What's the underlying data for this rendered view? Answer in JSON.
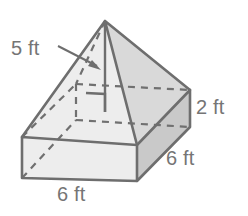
{
  "figure": {
    "name": "composite-solid-rectangular-prism-with-pyramid",
    "colors": {
      "outline": "#6e6e6e",
      "hidden_edge": "#6e6e6e",
      "face_left_pyramid": "#f2f2f2",
      "face_right_pyramid": "#d9d9d9",
      "face_top_prism": "#e0e0e0",
      "face_front_prism": "#ededed",
      "face_right_prism": "#c9c9c9",
      "label_text": "#757575",
      "background": "#ffffff"
    },
    "labels": {
      "slant_height": "5 ft",
      "prism_height": "2 ft",
      "prism_depth": "6 ft",
      "prism_width": "6 ft"
    },
    "annotations": {
      "right_angle_marker": "right-angle",
      "leader_arrow": "arrow pointing from 5 ft label to pyramid slant height"
    }
  }
}
